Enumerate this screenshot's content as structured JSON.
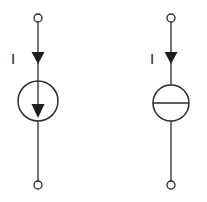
{
  "figure": {
    "background_color": "#ffffff",
    "line_color": "#2b2b2b",
    "fill_color": "#1e1e1e",
    "width": 207,
    "height": 202
  },
  "symbols": [
    {
      "id": "ideal-current-source",
      "name": "Ideal current source (arrow-in-circle)",
      "current_label": "I",
      "center_x": 38,
      "center_y": 101,
      "radius": 20,
      "top_terminal_y": 18,
      "bottom_terminal_y": 185,
      "terminal_radius": 4,
      "arrow_direction": "down",
      "inner_marking": "down-arrow",
      "label_x": 13,
      "label_y": 64
    },
    {
      "id": "constant-current-source",
      "name": "Constant current source (bar-in-circle)",
      "current_label": "I",
      "center_x": 171,
      "center_y": 103,
      "radius": 18,
      "top_terminal_y": 18,
      "bottom_terminal_y": 185,
      "terminal_radius": 4,
      "arrow_direction": "down",
      "inner_marking": "horizontal-bar",
      "label_x": 152,
      "label_y": 64
    }
  ],
  "annotations": {
    "current_label_left": "I",
    "current_label_right": "I"
  }
}
